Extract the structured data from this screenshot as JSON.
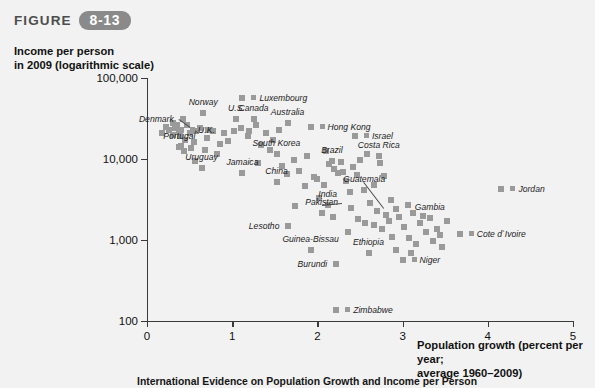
{
  "figure": {
    "word": "FIGURE",
    "number": "8-13",
    "caption": "International Evidence on Population Growth and Income per Person"
  },
  "chart_data": {
    "type": "scatter",
    "title": "",
    "xlabel": "Population growth (percent per year;\naverage 1960–2009)",
    "ylabel": "Income per person\nin 2009 (logarithmic scale)",
    "xlim": [
      0,
      5
    ],
    "ylim": [
      100,
      100000
    ],
    "yscale": "log",
    "grid": false,
    "legend": "none",
    "xticks": [
      "0",
      "1",
      "2",
      "3",
      "4",
      "5"
    ],
    "yticks": [
      "100,000",
      "10,000",
      "1,000",
      "100"
    ],
    "ytick_values": [
      100000,
      10000,
      1000,
      100
    ],
    "marker": "square",
    "marker_color": "#9a9a9a",
    "labeled_points": [
      {
        "name": "Luxembourg",
        "x": 1.12,
        "y": 57000,
        "side": "l"
      },
      {
        "name": "Denmark",
        "x": 0.42,
        "y": 31000,
        "side": "r",
        "leader": true
      },
      {
        "name": "Norway",
        "x": 0.66,
        "y": 37000,
        "side": "c"
      },
      {
        "name": "U.S.",
        "x": 1.05,
        "y": 31000,
        "side": "c"
      },
      {
        "name": "Canada",
        "x": 1.25,
        "y": 31000,
        "side": "c"
      },
      {
        "name": "Australia",
        "x": 1.65,
        "y": 28000,
        "side": "c"
      },
      {
        "name": "Hong Kong",
        "x": 1.92,
        "y": 25000,
        "side": "l"
      },
      {
        "name": "U.K.",
        "x": 0.4,
        "y": 23000,
        "side": "l"
      },
      {
        "name": "Israel",
        "x": 2.44,
        "y": 19000,
        "side": "l"
      },
      {
        "name": "Guatemala",
        "x": 2.55,
        "y": 4200,
        "side": "c",
        "leader": true
      },
      {
        "name": "Costa Rica",
        "x": 2.72,
        "y": 11000,
        "side": "c"
      },
      {
        "name": "Brazil",
        "x": 2.17,
        "y": 9500,
        "side": "c"
      },
      {
        "name": "South Korea",
        "x": 1.52,
        "y": 11500,
        "side": "c"
      },
      {
        "name": "Portugal",
        "x": 0.38,
        "y": 14000,
        "side": "c"
      },
      {
        "name": "Jamaica",
        "x": 1.12,
        "y": 6800,
        "side": "c"
      },
      {
        "name": "Uruguay",
        "x": 0.64,
        "y": 7800,
        "side": "c"
      },
      {
        "name": "China",
        "x": 1.52,
        "y": 5200,
        "side": "c"
      },
      {
        "name": "Jordan",
        "x": 4.16,
        "y": 4300,
        "side": "l"
      },
      {
        "name": "India",
        "x": 2.12,
        "y": 2700,
        "side": "c"
      },
      {
        "name": "Pakistan",
        "x": 2.05,
        "y": 2150,
        "side": "c",
        "leader": true
      },
      {
        "name": "Gambia",
        "x": 3.32,
        "y": 1850,
        "side": "c"
      },
      {
        "name": "Cote d`Ivoire",
        "x": 3.67,
        "y": 1180,
        "side": "l"
      },
      {
        "name": "Lesotho",
        "x": 1.66,
        "y": 1500,
        "side": "r"
      },
      {
        "name": "Guinea-Bissau",
        "x": 1.92,
        "y": 760,
        "side": "c"
      },
      {
        "name": "Ethiopia",
        "x": 2.6,
        "y": 700,
        "side": "c"
      },
      {
        "name": "Burundi",
        "x": 2.22,
        "y": 500,
        "side": "r"
      },
      {
        "name": "Niger",
        "x": 3.0,
        "y": 560,
        "side": "l"
      },
      {
        "name": "Zimbabwe",
        "x": 2.22,
        "y": 135,
        "side": "l"
      }
    ],
    "points": [
      [
        0.18,
        21000
      ],
      [
        0.22,
        25000
      ],
      [
        0.26,
        23000
      ],
      [
        0.3,
        28000
      ],
      [
        0.31,
        20000
      ],
      [
        0.33,
        24000
      ],
      [
        0.35,
        26000
      ],
      [
        0.37,
        22000
      ],
      [
        0.39,
        19000
      ],
      [
        0.42,
        31000
      ],
      [
        0.45,
        17000
      ],
      [
        0.47,
        26000
      ],
      [
        0.4,
        14500
      ],
      [
        0.44,
        12500
      ],
      [
        0.52,
        13500
      ],
      [
        0.55,
        16000
      ],
      [
        0.58,
        22000
      ],
      [
        0.62,
        24000
      ],
      [
        0.66,
        37000
      ],
      [
        0.7,
        18000
      ],
      [
        0.72,
        23000
      ],
      [
        0.78,
        22000
      ],
      [
        0.64,
        7800
      ],
      [
        0.86,
        15500
      ],
      [
        0.9,
        21000
      ],
      [
        0.95,
        16500
      ],
      [
        1.12,
        57000
      ],
      [
        1.05,
        31000
      ],
      [
        1.25,
        31000
      ],
      [
        1.02,
        22000
      ],
      [
        1.1,
        24000
      ],
      [
        1.18,
        19000
      ],
      [
        1.2,
        22000
      ],
      [
        1.28,
        26000
      ],
      [
        1.12,
        6800
      ],
      [
        1.34,
        15000
      ],
      [
        1.4,
        21000
      ],
      [
        1.52,
        11500
      ],
      [
        1.48,
        17000
      ],
      [
        1.55,
        23000
      ],
      [
        1.65,
        28000
      ],
      [
        1.92,
        25000
      ],
      [
        1.58,
        8200
      ],
      [
        1.64,
        6500
      ],
      [
        1.52,
        5200
      ],
      [
        1.66,
        1500
      ],
      [
        1.72,
        9800
      ],
      [
        1.78,
        7200
      ],
      [
        1.85,
        4600
      ],
      [
        1.88,
        11000
      ],
      [
        1.92,
        760
      ],
      [
        1.96,
        6000
      ],
      [
        2.02,
        3300
      ],
      [
        2.08,
        4800
      ],
      [
        2.12,
        2700
      ],
      [
        2.05,
        2150
      ],
      [
        2.17,
        9500
      ],
      [
        2.14,
        8600
      ],
      [
        2.2,
        7600
      ],
      [
        2.24,
        6800
      ],
      [
        2.22,
        500
      ],
      [
        2.22,
        135
      ],
      [
        2.28,
        9200
      ],
      [
        2.3,
        7000
      ],
      [
        2.34,
        5400
      ],
      [
        2.38,
        3900
      ],
      [
        2.44,
        19000
      ],
      [
        2.42,
        8000
      ],
      [
        2.46,
        6400
      ],
      [
        2.5,
        9800
      ],
      [
        2.55,
        4200
      ],
      [
        2.58,
        11500
      ],
      [
        2.6,
        700
      ],
      [
        2.62,
        2900
      ],
      [
        2.66,
        1550
      ],
      [
        2.7,
        2300
      ],
      [
        2.72,
        11000
      ],
      [
        2.74,
        9000
      ],
      [
        2.76,
        1350
      ],
      [
        2.8,
        2050
      ],
      [
        2.84,
        1700
      ],
      [
        2.86,
        3100
      ],
      [
        2.88,
        1100
      ],
      [
        2.92,
        2400
      ],
      [
        2.96,
        1900
      ],
      [
        3.0,
        560
      ],
      [
        3.02,
        1450
      ],
      [
        3.06,
        2700
      ],
      [
        3.08,
        1050
      ],
      [
        3.12,
        2150
      ],
      [
        3.16,
        880
      ],
      [
        3.2,
        1600
      ],
      [
        3.24,
        2000
      ],
      [
        3.28,
        1250
      ],
      [
        3.32,
        1850
      ],
      [
        3.36,
        960
      ],
      [
        3.4,
        1380
      ],
      [
        3.46,
        820
      ],
      [
        3.52,
        1700
      ],
      [
        3.67,
        1180
      ],
      [
        4.16,
        4300
      ],
      [
        2.1,
        12500
      ],
      [
        1.44,
        12800
      ],
      [
        0.82,
        11500
      ],
      [
        0.56,
        9500
      ],
      [
        2.36,
        1250
      ],
      [
        2.48,
        1800
      ],
      [
        2.66,
        4800
      ],
      [
        3.1,
        700
      ],
      [
        2.92,
        760
      ],
      [
        1.74,
        2600
      ],
      [
        2.0,
        5600
      ],
      [
        2.18,
        1950
      ],
      [
        2.4,
        2500
      ],
      [
        2.56,
        1600
      ],
      [
        1.3,
        9000
      ],
      [
        0.68,
        13000
      ],
      [
        0.5,
        21000
      ],
      [
        2.78,
        6200
      ],
      [
        3.44,
        1150
      ]
    ]
  }
}
